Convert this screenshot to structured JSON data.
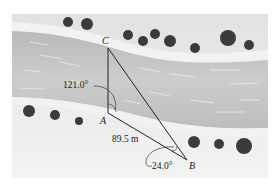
{
  "figure": {
    "points": {
      "A": {
        "label": "A"
      },
      "B": {
        "label": "B"
      },
      "C": {
        "label": "C"
      }
    },
    "measurements": {
      "angle_A": "121.0°",
      "side_AB": "89.5 m",
      "angle_B": "24.0°"
    },
    "colors": {
      "land": "#e6e6e6",
      "bank": "#f1f1f1",
      "river": "#c4c4c4",
      "bushes": "#3a3a3a",
      "lines": "#222222"
    }
  }
}
